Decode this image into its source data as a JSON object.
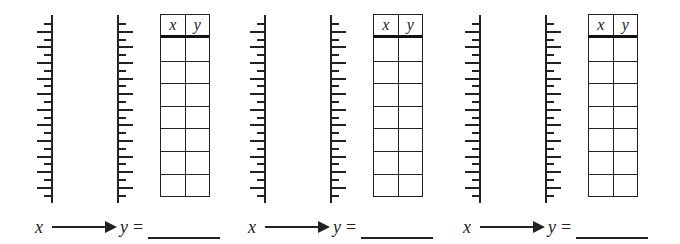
{
  "worksheet": {
    "groups": [
      {
        "table": {
          "headers": [
            "x",
            "y"
          ],
          "rows": 7
        },
        "rule": {
          "input_label": "x",
          "output_label": "y",
          "equals": "=",
          "answer": ""
        },
        "left_axis": {
          "ticks": 23
        },
        "right_axis": {
          "ticks": 23
        }
      },
      {
        "table": {
          "headers": [
            "x",
            "y"
          ],
          "rows": 7
        },
        "rule": {
          "input_label": "x",
          "output_label": "y",
          "equals": "=",
          "answer": ""
        },
        "left_axis": {
          "ticks": 23
        },
        "right_axis": {
          "ticks": 23
        }
      },
      {
        "table": {
          "headers": [
            "x",
            "y"
          ],
          "rows": 7
        },
        "rule": {
          "input_label": "x",
          "output_label": "y",
          "equals": "=",
          "answer": ""
        },
        "left_axis": {
          "ticks": 23
        },
        "right_axis": {
          "ticks": 23
        }
      }
    ]
  }
}
